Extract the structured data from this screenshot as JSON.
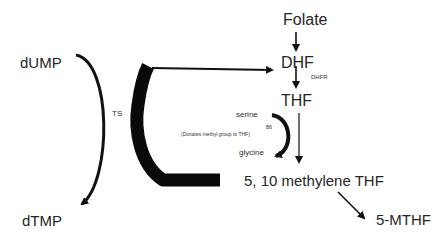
{
  "diagram": {
    "type": "metabolic-pathway",
    "nodes": {
      "folate": "Folate",
      "dhf": "DHF",
      "dhfr": "DHFR",
      "thf": "THF",
      "serine": "serine",
      "b6": "B6",
      "donates_note": "(Donates methyl group to THF)",
      "glycine": "glycine",
      "methylene_thf": "5, 10 methylene THF",
      "mthf": "5-MTHF",
      "dump": "dUMP",
      "ts": "TS",
      "dtmp": "dTMP"
    },
    "edges": [
      {
        "from": "Folate",
        "to": "DHF"
      },
      {
        "from": "DHF",
        "to": "THF",
        "enzyme": "DHFR"
      },
      {
        "from": "THF",
        "to": "5, 10 methylene THF"
      },
      {
        "from": "serine",
        "to": "glycine",
        "cofactor": "B6"
      },
      {
        "from": "5, 10 methylene THF",
        "to": "5-MTHF"
      },
      {
        "from": "dUMP",
        "to": "dTMP",
        "enzyme": "TS"
      },
      {
        "from": "5, 10 methylene THF",
        "to": "DHF",
        "via": "TS"
      }
    ]
  }
}
